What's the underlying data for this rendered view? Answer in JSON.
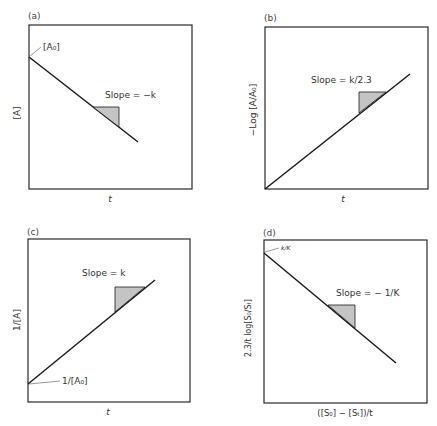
{
  "figure": {
    "panels": [
      {
        "id": "a",
        "label": "(a)",
        "ylabel": "[A]",
        "xlabel": "t",
        "intercept_label": "[A₀]",
        "slope_label": "Slope = −k",
        "line": "decreasing"
      },
      {
        "id": "b",
        "label": "(b)",
        "ylabel": "−Log [A/A₀]",
        "xlabel": "t",
        "slope_label": "Slope = k/2.3",
        "line": "increasing from origin"
      },
      {
        "id": "c",
        "label": "(c)",
        "ylabel": "1/[A]",
        "xlabel": "t",
        "intercept_label": "1/[A₀]",
        "slope_label": "Slope = k",
        "line": "increasing"
      },
      {
        "id": "d",
        "label": "(d)",
        "ylabel": "2.3/t log[S₀/Sₜ]",
        "xlabel": "([S₀] − [Sₜ])/t",
        "intercept_label": "k/K",
        "slope_label": "Slope = − 1/K",
        "line": "decreasing"
      }
    ]
  },
  "colors": {
    "line": "#1a1a1a",
    "frame": "#2a2a2a",
    "triangle_fill": "#c4c4c4"
  }
}
